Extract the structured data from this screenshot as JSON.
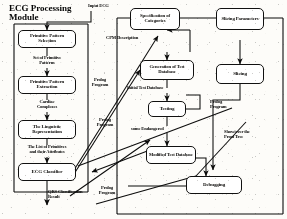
{
  "diagram": {
    "title_group": "ECG Processing\nModule",
    "input_label": "Input ECG",
    "output_label": "QRS Classification\nResult",
    "left_module": {
      "nodes": [
        {
          "id": "pps",
          "label": "Primitive Pattern\nSelection"
        },
        {
          "id": "ppe",
          "label": "Primitive Pattern\nExtraction"
        },
        {
          "id": "lingrep",
          "label": "The Linguistic\nRepresentation"
        },
        {
          "id": "classifier",
          "label": "ECG Classifier"
        }
      ],
      "flow_labels": [
        {
          "id": "set-of-primitive-patterns",
          "label": "Set of Primitive\nPatterns"
        },
        {
          "id": "cardiac-complexes",
          "label": "Cardiac\nComplexes"
        },
        {
          "id": "list-of-primitives",
          "label": "The List of Primitives\nand their Attributes"
        }
      ]
    },
    "right_module": {
      "nodes": [
        {
          "id": "spec-categories",
          "label": "Specification of\nCategories"
        },
        {
          "id": "slicing-parameters",
          "label": "Slicing\nParameters"
        },
        {
          "id": "gen-test-db",
          "label": "Generation of Test\nDatabase"
        },
        {
          "id": "testing",
          "label": "Testing"
        },
        {
          "id": "slicing",
          "label": "Slicing"
        },
        {
          "id": "debugging",
          "label": "Debugging"
        }
      ],
      "flow_labels": [
        {
          "id": "cpm-description",
          "label": "CPM Description"
        },
        {
          "id": "initial-test-database",
          "label": "Initial Test Database"
        },
        {
          "id": "some-endangered",
          "label": "some Endangered"
        },
        {
          "id": "modified-test-database",
          "label": "Modified\nTest Database"
        },
        {
          "id": "show-prove-proof-tree",
          "label": "Show/over the\nProof Tree"
        }
      ]
    },
    "prolog_labels": [
      {
        "id": "prolog-program-1",
        "label": "Prolog\nProgram"
      },
      {
        "id": "prolog-program-2",
        "label": "Prolog\nProgram"
      },
      {
        "id": "prolog-program-3",
        "label": "Prolog\nProgram"
      },
      {
        "id": "prolog-program-4",
        "label": "Prolog\nProgram"
      }
    ],
    "colors": {
      "ink": "#111111",
      "paper": "#f7f6f3",
      "node_fill": "#fdfcfa"
    }
  }
}
